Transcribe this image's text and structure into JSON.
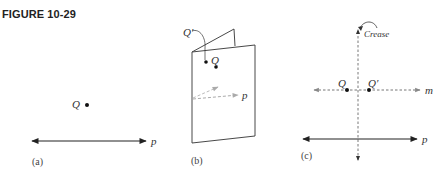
{
  "figure": {
    "title": "FIGURE 10-29"
  },
  "panels": {
    "a": {
      "caption": "(a)",
      "point_label": "Q",
      "line_label": "p"
    },
    "b": {
      "caption": "(b)",
      "point_label": "Q",
      "image_label": "Q′",
      "line_label": "p"
    },
    "c": {
      "caption": "(c)",
      "crease_label": "Crease",
      "point_label": "Q",
      "image_label": "Q′",
      "line_m_label": "m",
      "line_p_label": "p"
    }
  },
  "colors": {
    "ink": "#222222",
    "dashed_gray": "#999999",
    "background": "#ffffff"
  }
}
